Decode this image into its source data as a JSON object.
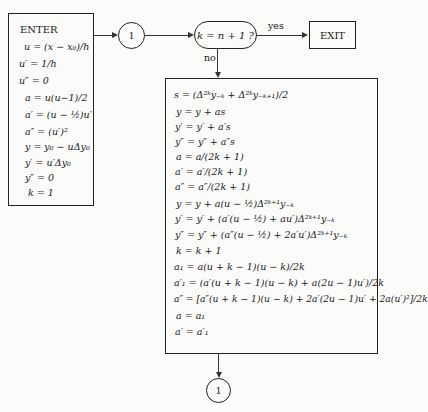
{
  "enter_box": {
    "title": "ENTER",
    "lines": [
      "u = (x − x₀)/h",
      "u′ = 1/h",
      "u″ = 0",
      "a = u(u−1)/2",
      "a′ = (u − ½)u′",
      "a″ = (u′)²",
      "y = y₀ − uΔy₀",
      "y′ = u′Δy₀",
      "y″ = 0",
      "k = 1"
    ]
  },
  "connector_top": {
    "label": "1"
  },
  "decision": {
    "label": "k = n + 1 ?",
    "yes_label": "yes",
    "no_label": "no"
  },
  "exit_box": {
    "label": "EXIT"
  },
  "main_box": {
    "lines": [
      "s = (Δ²ᵏy₋ₖ + Δ²ᵏy₋ₖ₊₁)/2",
      "y = y + as",
      "y′ = y′ + a′s",
      "y″ = y″ + a″s",
      "a = a/(2k + 1)",
      "a′ = a′/(2k + 1)",
      "a″ = a″/(2k + 1)",
      "y = y + a(u − ½)Δ²ᵏ⁺¹y₋ₖ",
      "y′ = y′ + (a′(u − ½) + au′)Δ²ᵏ⁺¹y₋ₖ",
      "y″ = y″ + (a″(u − ½) + 2a′u′)Δ²ᵏ⁺¹y₋ₖ",
      "k = k + 1",
      "a₁ = a(u + k − 1)(u − k)/2k",
      "a′₁ = (a′(u + k − 1)(u − k) + a(2u − 1)u′)/2k",
      "a″ = [a″(u + k − 1)(u − k) + 2a′(2u − 1)u′ + 2a(u′)²]/2k",
      "a = a₁",
      "a′ = a′₁"
    ]
  },
  "connector_bottom": {
    "label": "1"
  }
}
